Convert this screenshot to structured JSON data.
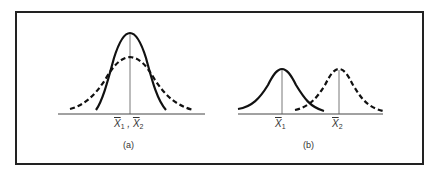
{
  "figure": {
    "panels": [
      {
        "id": "a",
        "caption": "(a)",
        "axis_label": {
          "x1": "X",
          "x1_sub": "1",
          "sep": " , ",
          "x2": "X",
          "x2_sub": "2"
        },
        "description": "Two distributions with equal means; solid narrow, dashed wide"
      },
      {
        "id": "b",
        "caption": "(b)",
        "labels": [
          {
            "text": "X",
            "sub": "1"
          },
          {
            "text": "X",
            "sub": "2"
          }
        ],
        "description": "Two distributions with equal spread, different means; solid left, dashed right"
      }
    ],
    "colors": {
      "line": "#111111",
      "axis": "#444444",
      "frame": "#222222"
    }
  }
}
